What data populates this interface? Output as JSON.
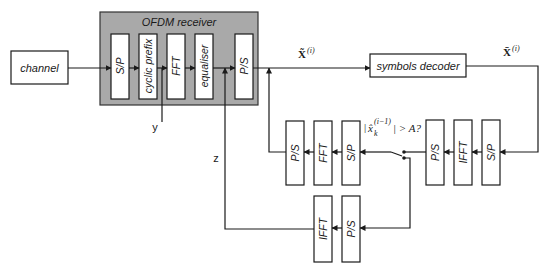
{
  "diagram": {
    "type": "block-diagram",
    "blocks": {
      "channel": "channel",
      "receiver_group": "OFDM receiver",
      "rx_sp": "S/P",
      "rx_cp": "cyclic prefix",
      "rx_fft": "FFT",
      "rx_eq": "equaliser",
      "rx_ps": "P/S",
      "decoder": "symbols decoder",
      "fb_sp": "S/P",
      "fb_ifft": "IFFT",
      "fb_ps": "P/S",
      "mid_sp": "S/P",
      "mid_fft": "FFT",
      "mid_ps": "P/S",
      "bot_ps": "P/S",
      "bot_ifft": "IFFT"
    },
    "signals": {
      "y": "y",
      "z": "z",
      "x_tilde": "X̃",
      "x_tilde_sup": "(i)",
      "x_bar": "X̄",
      "x_bar_sup": "(i)",
      "condition_pre": "|",
      "condition_x": "x̂",
      "condition_sub": "k",
      "condition_sup": "(i−1)",
      "condition_post": "| > A?"
    },
    "colors": {
      "group_fill": "#a9a9a9",
      "line": "#1a1a1a",
      "block_fill": "#ffffff"
    }
  }
}
